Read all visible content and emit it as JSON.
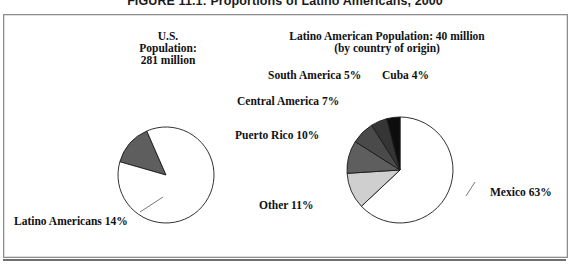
{
  "figure": {
    "caption": "FIGURE 11.1: Proportions of Latino Americans, 2000"
  },
  "left_panel": {
    "heading_line1": "U.S.",
    "heading_line2": "Population:",
    "heading_line3": "281 million",
    "callout_label": "Latino Americans 14%"
  },
  "right_panel": {
    "heading_line1": "Latino American Population: 40 million",
    "heading_line2": "(by country of origin)",
    "labels": {
      "south_america": "South America 5%",
      "cuba": "Cuba 4%",
      "central_america": "Central America 7%",
      "puerto_rico": "Puerto Rico 10%",
      "other": "Other 11%",
      "mexico": "Mexico 63%"
    }
  },
  "colors": {
    "outline": "#1a1a1a",
    "frame": "#8d8d8d",
    "mexico": "#ffffff",
    "other": "#cfcfcf",
    "puerto_rico": "#5e5e5e",
    "central_america": "#4a4a4a",
    "south_america": "#353535",
    "cuba": "#0d0d0d",
    "latino_wedge": "#5e5e5e",
    "non_latino": "#ffffff"
  },
  "chart_data": [
    {
      "type": "pie",
      "title": "U.S. Population: 281 million",
      "name": "us-population-pie",
      "categories": [
        "Latino Americans",
        "Other U.S. population"
      ],
      "values": [
        14,
        86
      ],
      "unit": "percent",
      "labels_shown": [
        "Latino Americans 14%"
      ],
      "legend": "none",
      "center": [
        166,
        175
      ],
      "radius": 48,
      "start_angle_deg": 196,
      "slice_colors": [
        "#5e5e5e",
        "#ffffff"
      ]
    },
    {
      "type": "pie",
      "title": "Latino American Population: 40 million (by country of origin)",
      "name": "latino-origin-pie",
      "categories": [
        "Mexico",
        "Other",
        "Puerto Rico",
        "Central America",
        "South America",
        "Cuba"
      ],
      "values": [
        63,
        11,
        10,
        7,
        5,
        4
      ],
      "unit": "percent",
      "labels_shown": [
        "Mexico 63%",
        "Other 11%",
        "Puerto Rico 10%",
        "Central America 7%",
        "South America 5%",
        "Cuba 4%"
      ],
      "legend": "none",
      "center": [
        400,
        170
      ],
      "radius": 53,
      "start_angle_deg": 270,
      "slice_colors": [
        "#ffffff",
        "#cfcfcf",
        "#5e5e5e",
        "#4a4a4a",
        "#353535",
        "#0d0d0d"
      ]
    }
  ]
}
